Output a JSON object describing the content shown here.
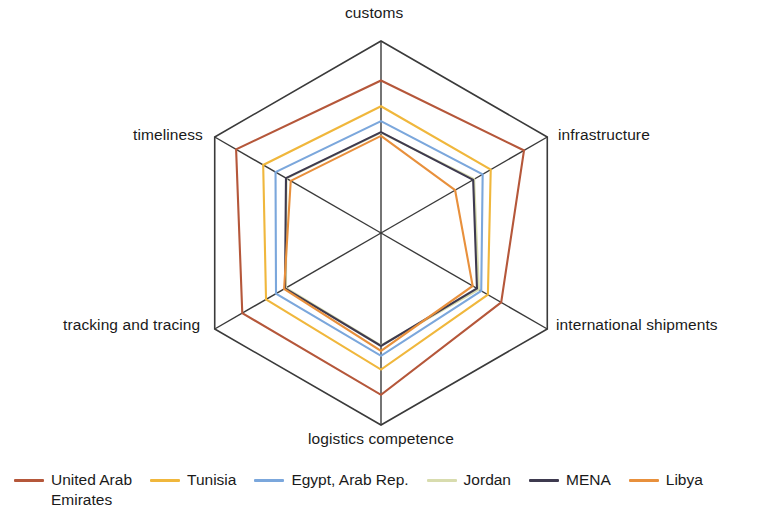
{
  "chart_data": {
    "type": "radar",
    "title": "",
    "categories": [
      "customs",
      "infrastructure",
      "international shipments",
      "logistics competence",
      "tracking and tracing",
      "timeliness"
    ],
    "value_range": [
      1.0,
      4.5
    ],
    "grid": "hexagon outline only, 6 spokes, no intermediate rings",
    "legend_position": "bottom",
    "series": [
      {
        "name": "United Arab Emirates",
        "color": "#B5573A",
        "values": [
          3.78,
          4.01,
          3.53,
          3.95,
          3.92,
          4.05
        ]
      },
      {
        "name": "Tunisia",
        "color": "#F0B73C",
        "values": [
          3.31,
          3.31,
          3.25,
          3.49,
          3.42,
          3.48
        ]
      },
      {
        "name": "Egypt, Arab Rep.",
        "color": "#7BA7DC",
        "values": [
          3.04,
          3.14,
          3.11,
          3.24,
          3.21,
          3.22
        ]
      },
      {
        "name": "Jordan",
        "color": "#D8DCAE",
        "values": [
          2.83,
          2.96,
          3.06,
          3.05,
          3.0,
          2.99
        ]
      },
      {
        "name": "MENA",
        "color": "#3E3A4F",
        "values": [
          2.84,
          2.94,
          3.02,
          3.06,
          3.02,
          3.0
        ]
      },
      {
        "name": "Libya",
        "color": "#E8903C",
        "values": [
          2.77,
          2.56,
          2.93,
          3.15,
          3.04,
          2.9
        ]
      }
    ]
  },
  "axes": {
    "customs": "customs",
    "infrastructure": "infrastructure",
    "international_shipments": "international shipments",
    "logistics_competence": "logistics competence",
    "tracking_and_tracing": "tracking and tracing",
    "timeliness": "timeliness"
  },
  "legend": {
    "items": [
      {
        "label": "United Arab\nEmirates",
        "color": "#B5573A"
      },
      {
        "label": "Tunisia",
        "color": "#F0B73C"
      },
      {
        "label": "Egypt, Arab Rep.",
        "color": "#7BA7DC"
      },
      {
        "label": "Jordan",
        "color": "#D8DCAE"
      },
      {
        "label": "MENA",
        "color": "#3E3A4F"
      },
      {
        "label": "Libya",
        "color": "#E8903C"
      }
    ]
  },
  "grid_color": "#3a3a3a"
}
